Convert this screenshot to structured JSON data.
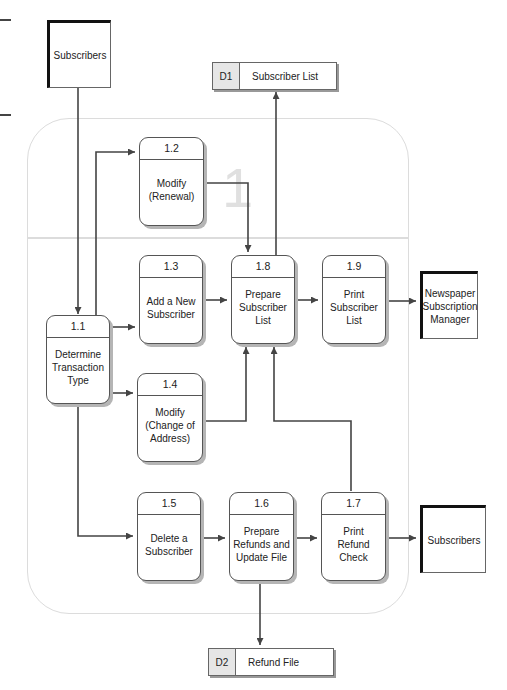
{
  "diagram": {
    "type": "data-flow-diagram",
    "region_label": "1",
    "external_entities": [
      {
        "id": "subscribers-top",
        "label": "Subscribers"
      },
      {
        "id": "newspaper-manager",
        "label": "Newspaper\nSubscription\nManager"
      },
      {
        "id": "subscribers-right",
        "label": "Subscribers"
      }
    ],
    "data_stores": [
      {
        "id": "D1",
        "label": "Subscriber List"
      },
      {
        "id": "D2",
        "label": "Refund File"
      }
    ],
    "processes": [
      {
        "id": "1.1",
        "label": "Determine\nTransaction\nType"
      },
      {
        "id": "1.2",
        "label": "Modify\n(Renewal)"
      },
      {
        "id": "1.3",
        "label": "Add a New\nSubscriber"
      },
      {
        "id": "1.4",
        "label": "Modify\n(Change of\nAddress)"
      },
      {
        "id": "1.5",
        "label": "Delete a\nSubscriber"
      },
      {
        "id": "1.6",
        "label": "Prepare\nRefunds and\nUpdate File"
      },
      {
        "id": "1.7",
        "label": "Print\nRefund\nCheck"
      },
      {
        "id": "1.8",
        "label": "Prepare\nSubscriber\nList"
      },
      {
        "id": "1.9",
        "label": "Print\nSubscriber\nList"
      }
    ],
    "flows": [
      {
        "from": "Subscribers",
        "to": "1.1"
      },
      {
        "from": "1.1",
        "to": "1.2"
      },
      {
        "from": "1.1",
        "to": "1.3"
      },
      {
        "from": "1.1",
        "to": "1.4"
      },
      {
        "from": "1.1",
        "to": "1.5"
      },
      {
        "from": "1.2",
        "to": "1.8"
      },
      {
        "from": "1.3",
        "to": "1.8"
      },
      {
        "from": "1.4",
        "to": "1.8"
      },
      {
        "from": "1.7",
        "to": "1.8"
      },
      {
        "from": "1.8",
        "to": "D1"
      },
      {
        "from": "1.8",
        "to": "1.9"
      },
      {
        "from": "1.9",
        "to": "Newspaper Subscription Manager"
      },
      {
        "from": "1.5",
        "to": "1.6"
      },
      {
        "from": "1.6",
        "to": "1.7"
      },
      {
        "from": "1.6",
        "to": "D2"
      },
      {
        "from": "1.7",
        "to": "Subscribers"
      }
    ]
  }
}
